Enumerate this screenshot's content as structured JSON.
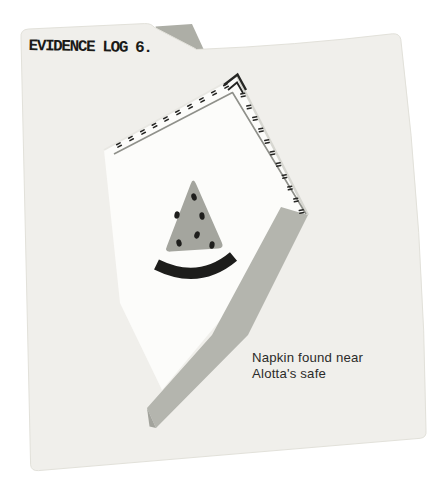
{
  "evidence_folder": {
    "tab_label": "EVIDENCE LOG 6.",
    "caption": {
      "line1": "Napkin found near",
      "line2": "Alotta's safe"
    },
    "illustration": "watermelon-slice-on-stitched-napkin",
    "colors": {
      "background": "#ffffff",
      "folder": "#f0efeb",
      "folder_edge": "#e2e1da",
      "back_flap": "#adaea6",
      "napkin": "#fcfcfa",
      "napkin_edge_light": "#d7d7d1",
      "napkin_edge_lighter": "#e8e7e2",
      "fold_band": "#b4b5ae",
      "band_tip": "#a2a39c",
      "stitch": "#262624",
      "inner_outline": "#8f908a",
      "watermelon_flesh": "#a4a59e",
      "watermelon_rind": "#1d1d1b",
      "watermelon_seed": "#1e1e1c",
      "tab_text": "#1a1a18",
      "caption_text": "#2b2b29"
    }
  }
}
